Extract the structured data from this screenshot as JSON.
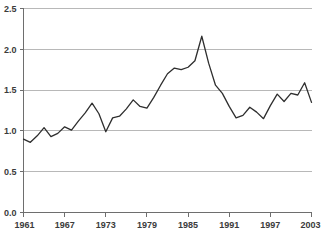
{
  "chart_data": {
    "type": "line",
    "title": "",
    "subtitle": "",
    "xlabel": "",
    "ylabel": "",
    "xlim": [
      1961,
      2003
    ],
    "ylim": [
      0.0,
      2.5
    ],
    "grid": true,
    "legend": false,
    "legend_position": "none",
    "line_color": "#2e2e2e",
    "grid_color": "#b8b8b8",
    "axis_color": "#6e6e6e",
    "text_color": "#3b3b3b",
    "y_ticks": [
      0.0,
      0.5,
      1.0,
      1.5,
      2.0,
      2.5
    ],
    "y_tick_labels": [
      "0.0",
      "0.5",
      "1.0",
      "1.5",
      "2.0",
      "2.5"
    ],
    "x_ticks": [
      1961,
      1967,
      1973,
      1979,
      1985,
      1991,
      1997,
      2003
    ],
    "x_tick_labels": [
      "1961",
      "1967",
      "1973",
      "1979",
      "1985",
      "1991",
      "1997",
      "2003"
    ],
    "x": [
      1961,
      1962,
      1963,
      1964,
      1965,
      1966,
      1967,
      1968,
      1969,
      1970,
      1971,
      1972,
      1973,
      1974,
      1975,
      1976,
      1977,
      1978,
      1979,
      1980,
      1981,
      1982,
      1983,
      1984,
      1985,
      1986,
      1987,
      1988,
      1989,
      1990,
      1991,
      1992,
      1993,
      1994,
      1995,
      1996,
      1997,
      1998,
      1999,
      2000,
      2001,
      2002,
      2003
    ],
    "values": [
      0.9,
      0.86,
      0.94,
      1.04,
      0.93,
      0.97,
      1.05,
      1.01,
      1.12,
      1.22,
      1.34,
      1.21,
      0.99,
      1.16,
      1.18,
      1.27,
      1.38,
      1.3,
      1.28,
      1.41,
      1.56,
      1.7,
      1.77,
      1.75,
      1.78,
      1.86,
      2.16,
      1.83,
      1.56,
      1.46,
      1.3,
      1.16,
      1.19,
      1.29,
      1.23,
      1.15,
      1.31,
      1.45,
      1.36,
      1.46,
      1.44,
      1.59,
      1.35
    ],
    "series": [
      {
        "name": "series-1",
        "values": [
          0.9,
          0.86,
          0.94,
          1.04,
          0.93,
          0.97,
          1.05,
          1.01,
          1.12,
          1.22,
          1.34,
          1.21,
          0.99,
          1.16,
          1.18,
          1.27,
          1.38,
          1.3,
          1.28,
          1.41,
          1.56,
          1.7,
          1.77,
          1.75,
          1.78,
          1.86,
          2.16,
          1.83,
          1.56,
          1.46,
          1.3,
          1.16,
          1.19,
          1.29,
          1.23,
          1.15,
          1.31,
          1.45,
          1.36,
          1.46,
          1.44,
          1.59,
          1.35
        ]
      }
    ],
    "annotations": []
  }
}
